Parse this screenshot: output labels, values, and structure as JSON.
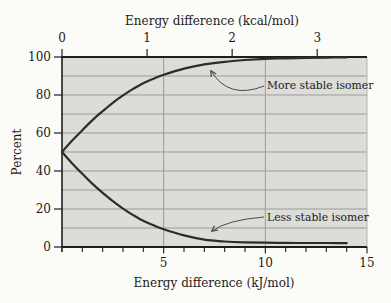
{
  "chart_data": {
    "type": "line",
    "title": "",
    "xlabel_top": "Energy difference (kcal/mol)",
    "xlabel_bottom": "Energy difference (kJ/mol)",
    "ylabel": "Percent",
    "xlim_kj": [
      0,
      15
    ],
    "ylim": [
      0,
      100
    ],
    "kj_per_kcal": 4.184,
    "grid": "on",
    "x_kj": [
      0,
      0.5,
      1,
      1.5,
      2,
      2.5,
      3,
      3.5,
      4,
      4.5,
      5,
      6,
      7,
      8,
      9,
      10,
      11,
      12,
      13,
      14
    ],
    "series": [
      {
        "name": "More stable isomer",
        "values": [
          50,
          56,
          61.5,
          66.8,
          71.5,
          75.9,
          79.8,
          83.2,
          86.2,
          88.6,
          90.7,
          93.9,
          96.1,
          97.5,
          98.4,
          99.0,
          99.3,
          99.5,
          99.7,
          99.8
        ]
      },
      {
        "name": "Less stable isomer",
        "values": [
          50,
          44,
          38.5,
          33.2,
          28.5,
          24.1,
          20.2,
          16.8,
          13.8,
          11.4,
          9.3,
          6.1,
          3.9,
          2.9,
          2.5,
          2.3,
          2.2,
          2.1,
          2.1,
          2.0
        ]
      }
    ],
    "axes": {
      "top": {
        "title": "Energy difference (kcal/mol)",
        "ticks": [
          {
            "label": "0",
            "kcal": 0
          },
          {
            "label": "1",
            "kcal": 1
          },
          {
            "label": "2",
            "kcal": 2
          },
          {
            "label": "3",
            "kcal": 3
          }
        ]
      },
      "bottom": {
        "title": "Energy difference (kJ/mol)",
        "labeled_ticks": [
          {
            "label": "5",
            "kj": 5
          },
          {
            "label": "10",
            "kj": 10
          },
          {
            "label": "15",
            "kj": 15
          }
        ],
        "minor_tick_step_kj": 1
      },
      "left": {
        "title": "Percent",
        "labeled_ticks": [
          {
            "label": "100",
            "pct": 100
          },
          {
            "label": "80",
            "pct": 80
          },
          {
            "label": "60",
            "pct": 60
          },
          {
            "label": "40",
            "pct": 40
          },
          {
            "label": "20",
            "pct": 20
          },
          {
            "label": "0",
            "pct": 0
          }
        ],
        "grid_step_pct": 10
      },
      "vertical_gridlines_kj": [
        5,
        10
      ]
    },
    "annotations": [
      {
        "series_index": 0,
        "label_x": 267,
        "label_y": 89,
        "arrow_from": [
          264,
          86
        ],
        "arrow_ctrl": [
          229,
          100
        ],
        "arrow_tip": [
          211,
          71
        ]
      },
      {
        "series_index": 1,
        "label_x": 267,
        "label_y": 221,
        "arrow_from": [
          264,
          217
        ],
        "arrow_ctrl": [
          227,
          220
        ],
        "arrow_tip": [
          212,
          231
        ]
      }
    ]
  },
  "colors": {
    "figure_bg": "#fbfbf8",
    "plot_bg": "#dcdcd9",
    "grid": "#9b9b98",
    "axis": "#1e1e1e",
    "curve": "#2e2c2a",
    "text": "#1b1b1b",
    "arrow": "#4a4a48",
    "plot_right_edge": "#b3b3b0"
  },
  "layout": {
    "plot_left": 62,
    "plot_right": 367,
    "plot_top": 57,
    "plot_bottom": 247
  }
}
